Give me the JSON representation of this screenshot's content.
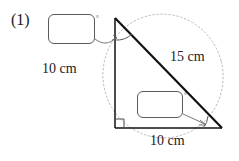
{
  "figure": {
    "problem_number": "(1)",
    "type": "right-triangle-geometry-diagram",
    "shape": "right triangle inscribed in dotted ellipse",
    "labels": {
      "left_side": "10 cm",
      "hypotenuse": "15 cm",
      "base": "10 cm"
    },
    "answer_boxes": [
      {
        "name": "apex-angle",
        "value": "",
        "unit_symbol": "°",
        "points_to": "angle at top vertex between vertical side and hypotenuse"
      },
      {
        "name": "base-angle",
        "value": "",
        "unit_symbol": "°",
        "points_to": "angle at bottom-right vertex between base and hypotenuse"
      }
    ],
    "marks": {
      "right_angle_vertex": "bottom-left",
      "right_angle_symbol": "square",
      "angle_arcs": [
        "apex",
        "bottom-right"
      ]
    },
    "colors": {
      "stroke": "#111111",
      "thin_stroke": "#5b5b5b",
      "dotted_guide": "#b8b0b0",
      "background": "#ffffff"
    },
    "geometry": {
      "apex": [
        115,
        18
      ],
      "bottom_left": [
        115,
        128
      ],
      "bottom_right": [
        222,
        128
      ]
    }
  }
}
